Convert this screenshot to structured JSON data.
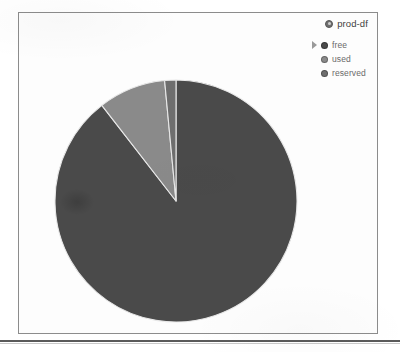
{
  "panel": {
    "title": "prod-df",
    "title_icon": "disk-dot-icon"
  },
  "legend": {
    "cursor_icon": "caret-right-icon",
    "items": [
      {
        "label": "free",
        "color": "#4a4a4a",
        "bullet_icon": "legend-bullet-icon"
      },
      {
        "label": "used",
        "color": "#8a8a8a",
        "bullet_icon": "legend-bullet-icon"
      },
      {
        "label": "reserved",
        "color": "#6e6e6e",
        "bullet_icon": "legend-bullet-icon"
      }
    ]
  },
  "chart_data": {
    "type": "pie",
    "title": "prod-df",
    "labels": [
      "free",
      "used",
      "reserved"
    ],
    "values": [
      89.5,
      9.0,
      1.5
    ],
    "unit": "%",
    "colors": [
      "#4a4a4a",
      "#8a8a8a",
      "#6e6e6e"
    ],
    "start_angle_deg": 0,
    "direction": "clockwise",
    "legend_position": "top-right",
    "grid": false,
    "xlabel": "",
    "ylabel": ""
  }
}
